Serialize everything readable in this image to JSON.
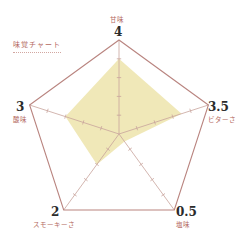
{
  "chart_data": {
    "type": "radar",
    "title": "味覚チャート",
    "scale": {
      "min": 0,
      "max": 5,
      "ticks": [
        1,
        2,
        3,
        4
      ]
    },
    "axes": [
      {
        "name": "甘味",
        "value": 4
      },
      {
        "name": "ビターさ",
        "value": 3.5
      },
      {
        "name": "塩味",
        "value": 0.5
      },
      {
        "name": "スモーキーさ",
        "value": 2
      },
      {
        "name": "酸味",
        "value": 3
      }
    ],
    "value_labels": [
      "4",
      "3.5",
      "0.5",
      "2",
      "3"
    ],
    "colors": {
      "fill": "#efe7b4",
      "outline": "#b9847f",
      "spokes": "#c8a39c",
      "label": "#b4685e",
      "value": "#2b2b2b"
    }
  }
}
